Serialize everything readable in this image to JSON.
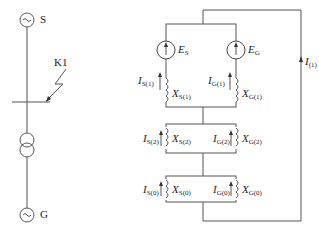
{
  "left_diagram": {
    "source_label": "S",
    "fault_label": "K1",
    "generator_label": "G"
  },
  "right_diagram": {
    "positive_sequence": {
      "emf_source": {
        "main": "E",
        "sub": "S"
      },
      "emf_generator": {
        "main": "E",
        "sub": "G"
      },
      "current_source": {
        "main": "I",
        "sub": "S(1)"
      },
      "current_generator": {
        "main": "I",
        "sub": "G(1)"
      },
      "reactance_source": {
        "main": "X",
        "sub": "S(1)"
      },
      "reactance_generator": {
        "main": "X",
        "sub": "G(1)"
      }
    },
    "negative_sequence": {
      "current_source": {
        "main": "I",
        "sub": "S(2)"
      },
      "current_generator": {
        "main": "I",
        "sub": "G(2)"
      },
      "reactance_source": {
        "main": "X",
        "sub": "S(2)"
      },
      "reactance_generator": {
        "main": "X",
        "sub": "G(2)"
      }
    },
    "zero_sequence": {
      "current_source": {
        "main": "I",
        "sub": "S(0)"
      },
      "current_generator": {
        "main": "I",
        "sub": "G(0)"
      },
      "reactance_source": {
        "main": "X",
        "sub": "S(0)"
      },
      "reactance_generator": {
        "main": "X",
        "sub": "G(0)"
      }
    },
    "loop_current": {
      "main": "I",
      "sub": "(1)"
    }
  }
}
